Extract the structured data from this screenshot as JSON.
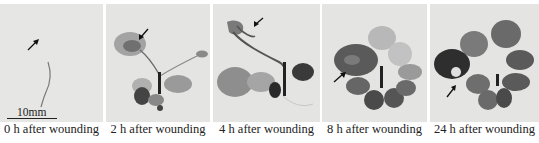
{
  "figure": {
    "scale_bar": {
      "label": "10mm"
    },
    "panels": [
      {
        "caption": "0 h after wounding",
        "arrow": "wound-site arrow"
      },
      {
        "caption": "2 h after wounding",
        "arrow": "wound-site arrow"
      },
      {
        "caption": "4 h after wounding",
        "arrow": "wound-site arrow"
      },
      {
        "caption": "8 h after wounding",
        "arrow": "wound-site arrow"
      },
      {
        "caption": "24 h after wounding",
        "arrow": "wound-site arrow"
      }
    ]
  }
}
